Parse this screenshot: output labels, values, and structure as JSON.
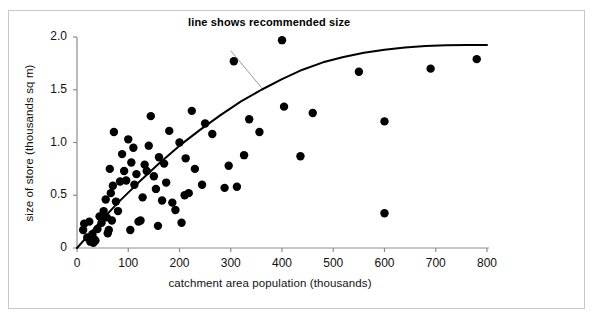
{
  "figure": {
    "background": "#ffffff",
    "frame_color": "#c8c8c8"
  },
  "annotation": {
    "text": "line shows recommended size"
  },
  "chart_data": {
    "type": "scatter",
    "title": "",
    "subtitle": "",
    "xlabel": "catchment area population (thousands)",
    "ylabel": "size of store (thousands sq m)",
    "xlim": [
      0,
      800
    ],
    "ylim": [
      0,
      2.0
    ],
    "grid": false,
    "legend": null,
    "marker_color": "#000000",
    "line_color": "#000000",
    "xticks": [
      0,
      100,
      200,
      300,
      400,
      500,
      600,
      700,
      800
    ],
    "xtick_labels": [
      "0",
      "100",
      "200",
      "300",
      "400",
      "500",
      "600",
      "700",
      "800"
    ],
    "yticks": [
      0,
      0.5,
      1.0,
      1.5,
      2.0
    ],
    "ytick_labels": [
      "0",
      "0.5",
      "1.0",
      "1.5",
      "2.0"
    ],
    "annotations": [
      {
        "text": "line shows recommended size",
        "leader_from": [
          300,
          1.87
        ],
        "leader_to": [
          360,
          1.52
        ]
      }
    ],
    "series": [
      {
        "name": "stores",
        "type": "scatter",
        "points": [
          [
            12,
            0.17
          ],
          [
            14,
            0.23
          ],
          [
            20,
            0.1
          ],
          [
            24,
            0.25
          ],
          [
            26,
            0.06
          ],
          [
            30,
            0.13
          ],
          [
            32,
            0.05
          ],
          [
            34,
            0.08
          ],
          [
            36,
            0.07
          ],
          [
            40,
            0.18
          ],
          [
            44,
            0.3
          ],
          [
            48,
            0.24
          ],
          [
            52,
            0.35
          ],
          [
            56,
            0.46
          ],
          [
            58,
            0.29
          ],
          [
            60,
            0.14
          ],
          [
            62,
            0.17
          ],
          [
            64,
            0.75
          ],
          [
            66,
            0.52
          ],
          [
            68,
            0.26
          ],
          [
            70,
            0.59
          ],
          [
            72,
            1.1
          ],
          [
            76,
            0.44
          ],
          [
            80,
            0.35
          ],
          [
            84,
            0.63
          ],
          [
            88,
            0.89
          ],
          [
            92,
            0.73
          ],
          [
            96,
            0.64
          ],
          [
            100,
            1.03
          ],
          [
            104,
            0.17
          ],
          [
            106,
            0.81
          ],
          [
            110,
            0.95
          ],
          [
            112,
            0.6
          ],
          [
            116,
            0.7
          ],
          [
            120,
            0.25
          ],
          [
            124,
            0.26
          ],
          [
            128,
            0.48
          ],
          [
            132,
            0.79
          ],
          [
            136,
            0.73
          ],
          [
            140,
            0.97
          ],
          [
            144,
            1.25
          ],
          [
            150,
            0.68
          ],
          [
            154,
            0.56
          ],
          [
            158,
            0.21
          ],
          [
            160,
            0.86
          ],
          [
            166,
            0.45
          ],
          [
            170,
            0.8
          ],
          [
            174,
            0.62
          ],
          [
            180,
            1.11
          ],
          [
            186,
            0.43
          ],
          [
            192,
            0.36
          ],
          [
            200,
            1.0
          ],
          [
            204,
            0.24
          ],
          [
            210,
            0.5
          ],
          [
            212,
            0.85
          ],
          [
            218,
            0.52
          ],
          [
            224,
            1.3
          ],
          [
            230,
            0.75
          ],
          [
            244,
            0.6
          ],
          [
            250,
            1.18
          ],
          [
            264,
            1.08
          ],
          [
            288,
            0.57
          ],
          [
            296,
            0.78
          ],
          [
            306,
            1.77
          ],
          [
            312,
            0.58
          ],
          [
            326,
            0.88
          ],
          [
            336,
            1.22
          ],
          [
            356,
            1.1
          ],
          [
            400,
            1.97
          ],
          [
            404,
            1.34
          ],
          [
            436,
            0.87
          ],
          [
            460,
            1.28
          ],
          [
            550,
            1.67
          ],
          [
            600,
            1.2
          ],
          [
            600,
            0.33
          ],
          [
            690,
            1.7
          ],
          [
            780,
            1.79
          ]
        ]
      },
      {
        "name": "recommended size",
        "type": "line",
        "curve": [
          [
            0,
            0.0
          ],
          [
            40,
            0.22
          ],
          [
            80,
            0.43
          ],
          [
            120,
            0.62
          ],
          [
            160,
            0.8
          ],
          [
            200,
            0.97
          ],
          [
            240,
            1.12
          ],
          [
            280,
            1.26
          ],
          [
            320,
            1.39
          ],
          [
            360,
            1.5
          ],
          [
            400,
            1.6
          ],
          [
            440,
            1.69
          ],
          [
            480,
            1.76
          ],
          [
            520,
            1.81
          ],
          [
            560,
            1.85
          ],
          [
            600,
            1.88
          ],
          [
            640,
            1.9
          ],
          [
            680,
            1.915
          ],
          [
            720,
            1.922
          ],
          [
            760,
            1.925
          ],
          [
            800,
            1.925
          ]
        ]
      }
    ]
  }
}
